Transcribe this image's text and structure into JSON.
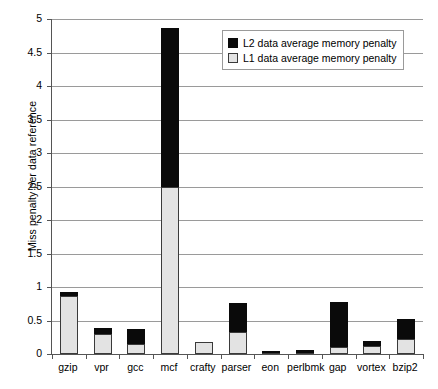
{
  "chart_data": {
    "type": "bar",
    "subtype": "stacked-bar",
    "title": "",
    "xlabel": "",
    "ylabel": "Miss penalty per data reference",
    "ylim": [
      0,
      5
    ],
    "ytick_step": 0.5,
    "ytick_labels": [
      "5",
      "4.5",
      "4",
      "3.5",
      "3",
      "2.5",
      "2",
      "1.5",
      "1",
      "0.5",
      "0"
    ],
    "ytick_values": [
      5,
      4.5,
      4,
      3.5,
      3,
      2.5,
      2,
      1.5,
      1,
      0.5,
      0
    ],
    "grid": "horizontal",
    "legend_position": "top-right-inside",
    "categories": [
      "gzip",
      "vpr",
      "gcc",
      "mcf",
      "crafty",
      "parser",
      "eon",
      "perlbmk",
      "gap",
      "vortex",
      "bzip2"
    ],
    "series": [
      {
        "name": "L1 data average memory penalty",
        "color": "#e3e3e3",
        "values": [
          0.86,
          0.3,
          0.15,
          2.5,
          0.18,
          0.33,
          0.01,
          0.02,
          0.1,
          0.12,
          0.22
        ]
      },
      {
        "name": "L2 data average memory penalty",
        "color": "#0a0a0a",
        "values": [
          0.06,
          0.09,
          0.22,
          2.37,
          0.0,
          0.43,
          0.01,
          0.04,
          0.67,
          0.08,
          0.31
        ]
      }
    ],
    "totals": [
      0.92,
      0.39,
      0.37,
      4.87,
      0.18,
      0.76,
      0.02,
      0.06,
      0.77,
      0.2,
      0.53
    ]
  },
  "legend": {
    "entries": [
      {
        "label": "L2 data average memory penalty"
      },
      {
        "label": "L1 data average memory penalty"
      }
    ]
  }
}
